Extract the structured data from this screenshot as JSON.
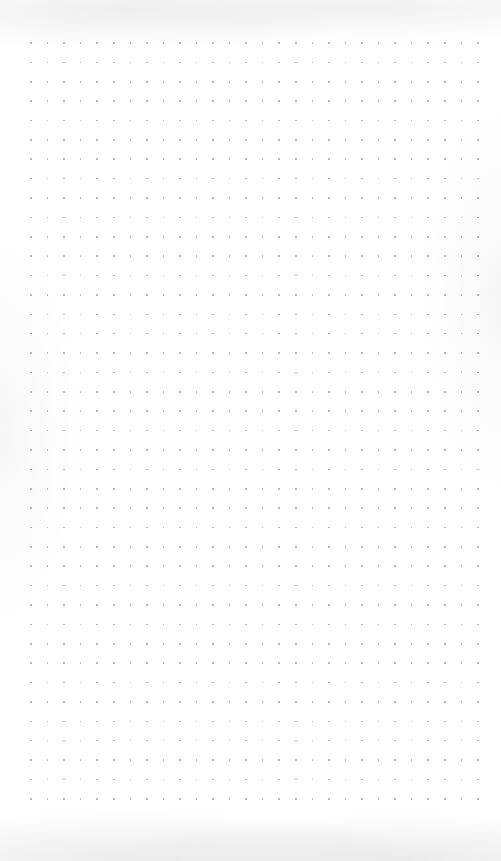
{
  "page": {
    "type": "dot-grid-paper",
    "width": 501,
    "height": 861,
    "background_color": "#ffffff"
  },
  "grid": {
    "columns": 28,
    "rows": 40,
    "origin_x": 31,
    "origin_y": 43,
    "step_x": 16.55,
    "step_y": 19.38,
    "dot_color": "#a9a9a9",
    "dot_size": 1.6
  }
}
